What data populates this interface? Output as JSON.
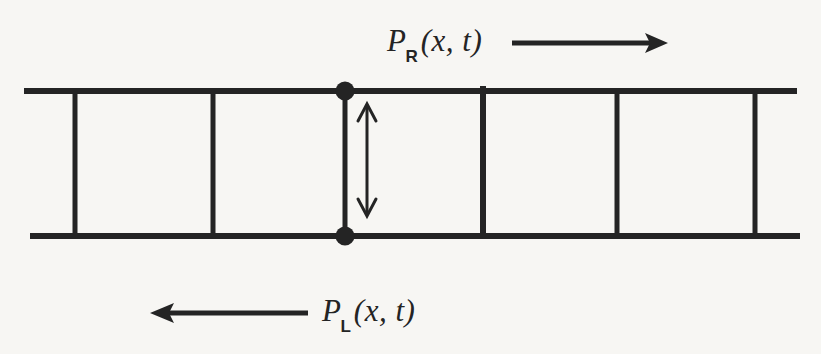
{
  "figure": {
    "type": "transmission-line-ladder-diagram",
    "background_color": "#f7f6f3",
    "ink_color": "#242424",
    "labels": {
      "right_moving": {
        "symbol": "P",
        "subscript": "R",
        "arguments": "(x, t)",
        "full_text": "P_R(x,t)",
        "direction": "right",
        "arrow_glyph": "⟶"
      },
      "left_moving": {
        "symbol": "P",
        "subscript": "L",
        "arguments": "(x, t)",
        "full_text": "P_L(x,t)",
        "direction": "left",
        "arrow_glyph": "⟵"
      }
    },
    "ladder": {
      "top_rail": {
        "x1": 24,
        "x2": 797,
        "y": 91
      },
      "bottom_rail": {
        "x1": 30,
        "x2": 800,
        "y": 236
      },
      "rung_x_positions": [
        75,
        213,
        345,
        483,
        617,
        755
      ],
      "node_dots": [
        {
          "x": 345,
          "y": 91,
          "r": 9
        },
        {
          "x": 345,
          "y": 236,
          "r": 9
        }
      ],
      "double_arrow": {
        "x": 367,
        "y_top": 104,
        "y_bottom": 216
      }
    },
    "arrows": {
      "top": {
        "x1": 512,
        "x2": 666,
        "y": 43,
        "points": "right"
      },
      "bottom": {
        "x1": 308,
        "x2": 150,
        "y": 313,
        "points": "left"
      }
    }
  }
}
